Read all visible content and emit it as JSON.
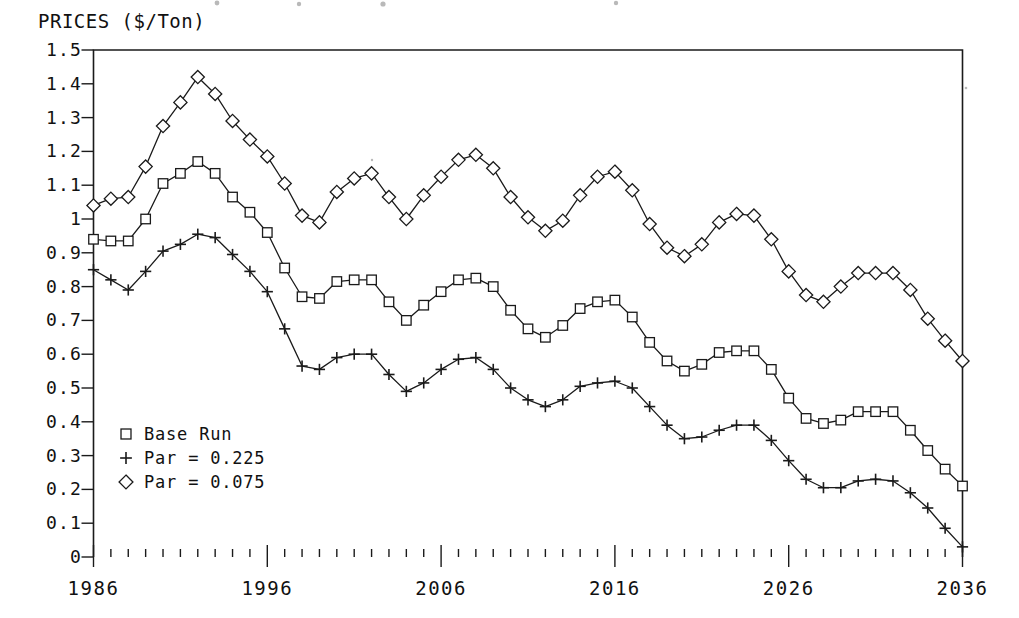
{
  "chart_data": {
    "type": "line",
    "title": "PRICES ($/Ton)",
    "xlabel": "",
    "ylabel": "PRICES ($/Ton)",
    "xlim": [
      1986,
      2036
    ],
    "ylim": [
      0,
      1.5
    ],
    "grid": false,
    "legend_position": "inside-lower-left",
    "y_ticks": [
      "1.5",
      "1.4",
      "1.3",
      "1.2",
      "1.1",
      "1",
      "0.9",
      "0.8",
      "0.7",
      "0.6",
      "0.5",
      "0.4",
      "0.3",
      "0.2",
      "0.1",
      "0"
    ],
    "y_tick_values": [
      1.5,
      1.4,
      1.3,
      1.2,
      1.1,
      1.0,
      0.9,
      0.8,
      0.7,
      0.6,
      0.5,
      0.4,
      0.3,
      0.2,
      0.1,
      0
    ],
    "x_ticks": [
      "1986",
      "1996",
      "2006",
      "2016",
      "2026",
      "2036"
    ],
    "x_tick_values": [
      1986,
      1996,
      2006,
      2016,
      2026,
      2036
    ],
    "x_minor_tick_step": 1,
    "x": [
      1986,
      1987,
      1988,
      1989,
      1990,
      1991,
      1992,
      1993,
      1994,
      1995,
      1996,
      1997,
      1998,
      1999,
      2000,
      2001,
      2002,
      2003,
      2004,
      2005,
      2006,
      2007,
      2008,
      2009,
      2010,
      2011,
      2012,
      2013,
      2014,
      2015,
      2016,
      2017,
      2018,
      2019,
      2020,
      2021,
      2022,
      2023,
      2024,
      2025,
      2026,
      2027,
      2028,
      2029,
      2030,
      2031,
      2032,
      2033,
      2034,
      2035,
      2036
    ],
    "series": [
      {
        "name": "Base Run",
        "marker": "square",
        "values": [
          0.94,
          0.935,
          0.935,
          1.0,
          1.105,
          1.135,
          1.17,
          1.135,
          1.065,
          1.02,
          0.96,
          0.855,
          0.77,
          0.765,
          0.815,
          0.82,
          0.82,
          0.755,
          0.7,
          0.745,
          0.785,
          0.82,
          0.825,
          0.8,
          0.73,
          0.675,
          0.65,
          0.685,
          0.735,
          0.755,
          0.76,
          0.71,
          0.635,
          0.58,
          0.55,
          0.57,
          0.605,
          0.61,
          0.61,
          0.555,
          0.47,
          0.41,
          0.395,
          0.405,
          0.43,
          0.43,
          0.43,
          0.375,
          0.315,
          0.26,
          0.21
        ]
      },
      {
        "name": "Par = 0.225",
        "marker": "plus",
        "values": [
          0.85,
          0.82,
          0.79,
          0.845,
          0.905,
          0.925,
          0.955,
          0.945,
          0.895,
          0.845,
          0.785,
          0.675,
          0.565,
          0.555,
          0.59,
          0.6,
          0.6,
          0.54,
          0.49,
          0.515,
          0.555,
          0.585,
          0.59,
          0.555,
          0.5,
          0.465,
          0.445,
          0.465,
          0.505,
          0.515,
          0.52,
          0.5,
          0.445,
          0.39,
          0.35,
          0.355,
          0.375,
          0.39,
          0.39,
          0.345,
          0.285,
          0.23,
          0.205,
          0.205,
          0.225,
          0.23,
          0.225,
          0.19,
          0.145,
          0.085,
          0.03
        ]
      },
      {
        "name": "Par = 0.075",
        "marker": "diamond",
        "values": [
          1.04,
          1.06,
          1.065,
          1.155,
          1.275,
          1.345,
          1.42,
          1.37,
          1.29,
          1.235,
          1.185,
          1.105,
          1.01,
          0.99,
          1.08,
          1.12,
          1.135,
          1.065,
          1.0,
          1.07,
          1.125,
          1.175,
          1.19,
          1.15,
          1.065,
          1.005,
          0.965,
          0.995,
          1.07,
          1.125,
          1.14,
          1.085,
          0.985,
          0.915,
          0.89,
          0.925,
          0.99,
          1.015,
          1.01,
          0.94,
          0.845,
          0.775,
          0.755,
          0.8,
          0.84,
          0.84,
          0.84,
          0.79,
          0.705,
          0.64,
          0.58
        ]
      }
    ],
    "legend": [
      {
        "label": "Base Run",
        "marker": "square"
      },
      {
        "label": "Par = 0.225",
        "marker": "plus"
      },
      {
        "label": "Par = 0.075",
        "marker": "diamond"
      }
    ]
  },
  "style": {
    "ink": "#1a1a1a",
    "paper": "#ffffff"
  }
}
